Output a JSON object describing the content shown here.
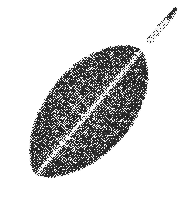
{
  "image": {
    "kind": "halftone-print-photograph",
    "subject": "leaf",
    "caption": "Single elliptical leaf specimen, halftone print",
    "width": 196,
    "height": 204,
    "background_color": "#ffffff",
    "ink_color": "#1a1a1a",
    "texture": "halftone-dot-screen",
    "halftone_cell_px": 2,
    "halftone_angle_deg": 45,
    "grain_amount": 0.22
  },
  "leaf": {
    "label": "leaf-blade",
    "shape": "elliptic-ovate",
    "orientation_deg": -50,
    "center": {
      "x": 88,
      "y": 112
    },
    "semi_major_px": 82,
    "semi_minor_px": 44,
    "base_tone": "#3a3a3a",
    "edge_tone": "#2a2a2a",
    "highlight_tone": "#8c8c8c",
    "tip": {
      "x": 24,
      "y": 188
    },
    "shoulder": {
      "x": 150,
      "y": 40
    }
  },
  "midrib": {
    "label": "midrib",
    "start": {
      "x": 30,
      "y": 182
    },
    "end": {
      "x": 152,
      "y": 38
    },
    "color": "#e2e2e2",
    "width_px": 2.1
  },
  "petiole": {
    "label": "petiole",
    "start": {
      "x": 150,
      "y": 40
    },
    "end": {
      "x": 172,
      "y": 14
    },
    "color": "#efefef",
    "edge_color": "#9a9a9a",
    "width_px": 4.5
  },
  "petiole_tip": {
    "label": "petiole-cut-tip",
    "position": {
      "x": 172,
      "y": 13
    },
    "color": "#2b2b2b",
    "length_px": 11,
    "width_px": 5
  },
  "veins": {
    "label": "secondary-veins",
    "color": "#6e6e6e",
    "count": 16,
    "pairs": [
      {
        "t": -0.74,
        "reach": 0.52,
        "sweep": 0.3
      },
      {
        "t": -0.62,
        "reach": 0.66,
        "sweep": 0.3
      },
      {
        "t": -0.5,
        "reach": 0.78,
        "sweep": 0.3
      },
      {
        "t": -0.37,
        "reach": 0.88,
        "sweep": 0.29
      },
      {
        "t": -0.24,
        "reach": 0.95,
        "sweep": 0.28
      },
      {
        "t": -0.1,
        "reach": 0.99,
        "sweep": 0.27
      },
      {
        "t": 0.04,
        "reach": 1.0,
        "sweep": 0.26
      },
      {
        "t": 0.18,
        "reach": 0.97,
        "sweep": 0.25
      },
      {
        "t": 0.32,
        "reach": 0.91,
        "sweep": 0.25
      },
      {
        "t": 0.45,
        "reach": 0.82,
        "sweep": 0.25
      },
      {
        "t": 0.57,
        "reach": 0.7,
        "sweep": 0.26
      },
      {
        "t": 0.68,
        "reach": 0.57,
        "sweep": 0.27
      }
    ]
  }
}
